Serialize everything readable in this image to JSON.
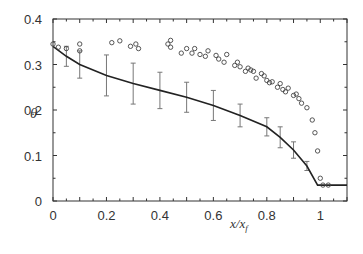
{
  "chart_data": {
    "type": "scatter",
    "title": "",
    "xlabel": "x/x_f",
    "xlabel_main": "x/x",
    "xlabel_sub": "f",
    "ylabel": "θ",
    "xlim": [
      0,
      1.1
    ],
    "ylim": [
      0,
      0.4
    ],
    "grid": false,
    "legend": null,
    "x_ticks": [
      0,
      0.2,
      0.4,
      0.6,
      0.8,
      1
    ],
    "x_tick_labels": [
      "0",
      "0.2",
      "0.4",
      "0.6",
      "0.8",
      "1"
    ],
    "y_ticks": [
      0,
      0.1,
      0.2,
      0.3,
      0.4
    ],
    "y_tick_labels": [
      "0",
      "0.1",
      "0.2",
      "0.3",
      "0.4"
    ],
    "series": [
      {
        "name": "model curve",
        "type": "line",
        "color": "#222222",
        "x": [
          0,
          0.05,
          0.1,
          0.2,
          0.3,
          0.4,
          0.5,
          0.6,
          0.7,
          0.8,
          0.85,
          0.9,
          0.95,
          0.99,
          1.1
        ],
        "y": [
          0.34,
          0.318,
          0.3,
          0.276,
          0.258,
          0.243,
          0.228,
          0.21,
          0.188,
          0.163,
          0.14,
          0.112,
          0.077,
          0.035,
          0.035
        ]
      },
      {
        "name": "error bars",
        "type": "errorbar",
        "color": "#777777",
        "x": [
          0.05,
          0.1,
          0.2,
          0.3,
          0.4,
          0.5,
          0.6,
          0.7,
          0.8,
          0.85,
          0.9,
          0.95
        ],
        "y": [
          0.318,
          0.3,
          0.276,
          0.258,
          0.243,
          0.228,
          0.21,
          0.188,
          0.163,
          0.14,
          0.112,
          0.077
        ],
        "err": [
          0.022,
          0.03,
          0.045,
          0.045,
          0.04,
          0.033,
          0.033,
          0.025,
          0.02,
          0.023,
          0.018,
          0.01
        ]
      },
      {
        "name": "data points",
        "type": "scatter",
        "marker": "open-circle",
        "color": "#444444",
        "x": [
          0.0,
          0.02,
          0.05,
          0.1,
          0.1,
          0.22,
          0.25,
          0.29,
          0.31,
          0.32,
          0.43,
          0.44,
          0.44,
          0.48,
          0.5,
          0.52,
          0.53,
          0.55,
          0.57,
          0.58,
          0.61,
          0.62,
          0.64,
          0.65,
          0.68,
          0.69,
          0.7,
          0.72,
          0.73,
          0.74,
          0.75,
          0.76,
          0.78,
          0.79,
          0.8,
          0.81,
          0.82,
          0.84,
          0.85,
          0.86,
          0.87,
          0.88,
          0.9,
          0.91,
          0.92,
          0.93,
          0.95,
          0.97,
          0.98,
          0.99,
          1.0,
          1.01,
          1.03
        ],
        "y": [
          0.345,
          0.338,
          0.335,
          0.33,
          0.345,
          0.348,
          0.352,
          0.34,
          0.345,
          0.335,
          0.345,
          0.353,
          0.338,
          0.325,
          0.335,
          0.325,
          0.335,
          0.322,
          0.318,
          0.33,
          0.32,
          0.312,
          0.305,
          0.322,
          0.298,
          0.305,
          0.295,
          0.285,
          0.292,
          0.288,
          0.285,
          0.27,
          0.28,
          0.275,
          0.265,
          0.26,
          0.262,
          0.25,
          0.258,
          0.245,
          0.24,
          0.248,
          0.232,
          0.235,
          0.225,
          0.215,
          0.205,
          0.178,
          0.15,
          0.11,
          0.05,
          0.035,
          0.035
        ]
      }
    ]
  }
}
